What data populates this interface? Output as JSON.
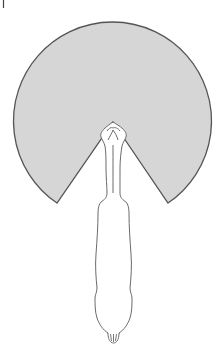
{
  "figure": {
    "colors": {
      "sector_fill": "#d6d6d6",
      "sector_stroke": "#555555",
      "body_stroke": "#6a6a6a",
      "background": "#ffffff"
    },
    "sector": {
      "center": [
        112,
        112
      ],
      "radius": 99,
      "apex": [
        113,
        122
      ],
      "left_tip": [
        57,
        203
      ],
      "right_tip": [
        168,
        203
      ]
    },
    "corner_mark": {
      "x": 3,
      "y": 0,
      "height": 8
    }
  }
}
